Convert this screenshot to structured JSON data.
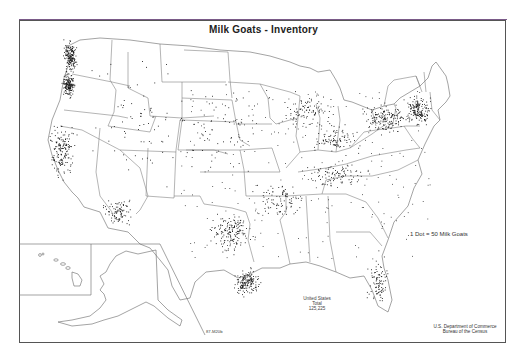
{
  "map": {
    "title": "Milk Goats - Inventory",
    "legend": "1 Dot = 50 Milk Goats",
    "total_label_line1": "United States",
    "total_label_line2": "Total",
    "total_value": "125,225",
    "credit_line1": "U.S. Department of Commerce",
    "credit_line2": "Bureau of the Census",
    "map_id": "87-M20b",
    "dot_value": 50,
    "dot_color": "#111111",
    "border_color": "#555555",
    "insets": [
      "Alaska",
      "Hawaii"
    ],
    "dot_density_regions": [
      {
        "region": "Washington west coast",
        "density": "high"
      },
      {
        "region": "Oregon Willamette",
        "density": "high"
      },
      {
        "region": "California central/north",
        "density": "high"
      },
      {
        "region": "Arizona central",
        "density": "medium"
      },
      {
        "region": "Texas central",
        "density": "high"
      },
      {
        "region": "Texas gulf coast",
        "density": "high"
      },
      {
        "region": "Missouri / Arkansas Ozarks",
        "density": "medium"
      },
      {
        "region": "Wisconsin / Michigan",
        "density": "medium"
      },
      {
        "region": "Ohio / Indiana",
        "density": "medium"
      },
      {
        "region": "Pennsylvania / New York",
        "density": "high"
      },
      {
        "region": "New England",
        "density": "high"
      },
      {
        "region": "Tennessee / Kentucky",
        "density": "medium"
      },
      {
        "region": "Florida",
        "density": "medium"
      },
      {
        "region": "Great Plains",
        "density": "low"
      },
      {
        "region": "Mountain West",
        "density": "low"
      }
    ]
  }
}
